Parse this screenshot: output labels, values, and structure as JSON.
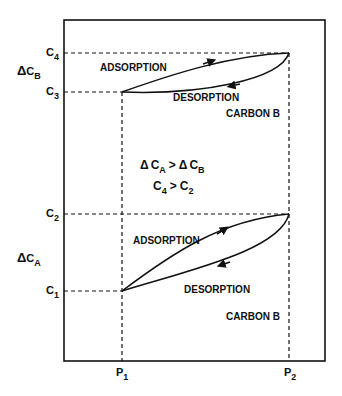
{
  "diagram": {
    "axis_labels": {
      "y_ticks": [
        {
          "main": "C",
          "sub": "4",
          "y": 53
        },
        {
          "main": "C",
          "sub": "3",
          "y": 92
        },
        {
          "main": "C",
          "sub": "2",
          "y": 214
        },
        {
          "main": "C",
          "sub": "1",
          "y": 291
        }
      ],
      "x_ticks": [
        {
          "main": "P",
          "sub": "1",
          "x": 122
        },
        {
          "main": "P",
          "sub": "2",
          "x": 289
        }
      ]
    },
    "delta_labels": {
      "delta_cb": {
        "symbol": "Δ",
        "main": "C",
        "sub": "B"
      },
      "delta_ca": {
        "symbol": "Δ",
        "main": "C",
        "sub": "A"
      }
    },
    "upper_loop": {
      "adsorption": "ADSORPTION",
      "desorption": "DESORPTION",
      "carbon": "CARBON B"
    },
    "lower_loop": {
      "adsorption": "ADSORPTION",
      "desorption": "DESORPTION",
      "carbon": "CARBON B"
    },
    "relations": {
      "line1": {
        "d1": "Δ",
        "c1": "C",
        "s1": "A",
        "op": ">",
        "d2": "Δ",
        "c2": "C",
        "s2": "B"
      },
      "line2": {
        "c1": "C",
        "s1": "4",
        "op": ">",
        "c2": "C",
        "s2": "2"
      }
    },
    "colors": {
      "ink": "#111111",
      "background": "#ffffff"
    }
  }
}
